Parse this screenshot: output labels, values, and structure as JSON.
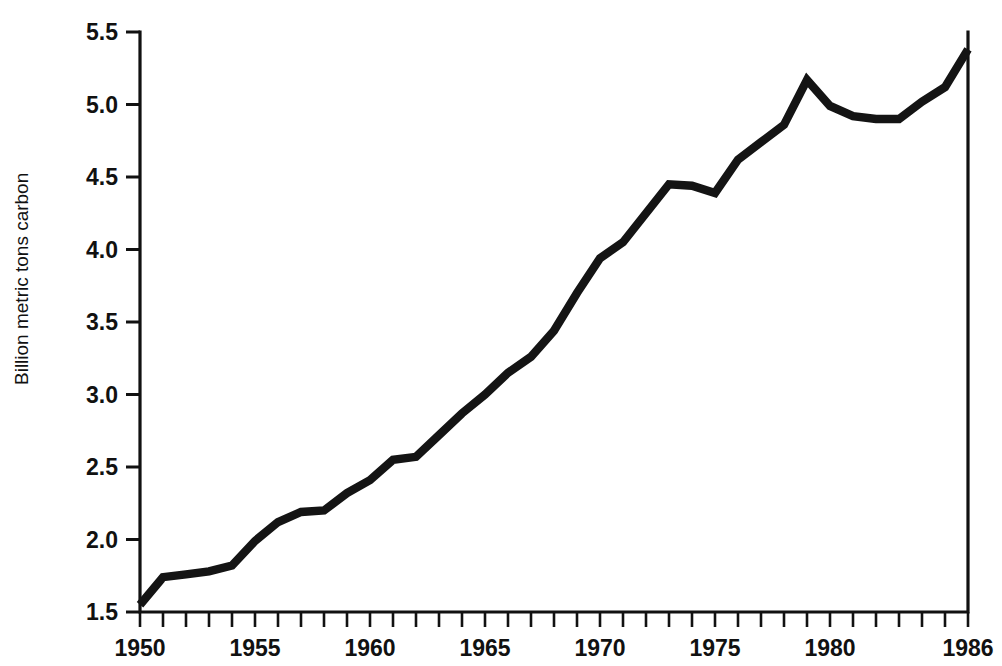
{
  "chart_data": {
    "type": "line",
    "title": "",
    "subtitle": "",
    "xlabel": "",
    "ylabel": "Billion metric tons carbon",
    "xlim": [
      1950,
      1986
    ],
    "ylim": [
      1.5,
      5.5
    ],
    "grid": false,
    "legend": "none",
    "y_ticks": [
      "1.5",
      "2.0",
      "2.5",
      "3.0",
      "3.5",
      "4.0",
      "4.5",
      "5.0",
      "5.5"
    ],
    "y_tick_values": [
      1.5,
      2.0,
      2.5,
      3.0,
      3.5,
      4.0,
      4.5,
      5.0,
      5.5
    ],
    "x_ticks_labeled": [
      "1950",
      "1955",
      "1960",
      "1965",
      "1970",
      "1975",
      "1980",
      "1986"
    ],
    "x_tick_values_labeled": [
      1950,
      1955,
      1960,
      1965,
      1970,
      1975,
      1980,
      1986
    ],
    "x_tick_minor_interval": 1,
    "line_color": "#141414",
    "x": [
      1950,
      1951,
      1952,
      1953,
      1954,
      1955,
      1956,
      1957,
      1958,
      1959,
      1960,
      1961,
      1962,
      1963,
      1964,
      1965,
      1966,
      1967,
      1968,
      1969,
      1970,
      1971,
      1972,
      1973,
      1974,
      1975,
      1976,
      1977,
      1978,
      1979,
      1980,
      1981,
      1982,
      1983,
      1984,
      1985,
      1986
    ],
    "values": [
      1.55,
      1.74,
      1.76,
      1.78,
      1.82,
      1.99,
      2.12,
      2.19,
      2.2,
      2.32,
      2.41,
      2.55,
      2.57,
      2.72,
      2.87,
      3.0,
      3.15,
      3.26,
      3.44,
      3.7,
      3.94,
      4.05,
      4.25,
      4.45,
      4.44,
      4.39,
      4.62,
      4.74,
      4.86,
      5.17,
      4.99,
      4.92,
      4.9,
      4.9,
      5.02,
      5.12,
      5.38
    ],
    "series": [
      {
        "name": "Global carbon emissions",
        "values": [
          1.55,
          1.74,
          1.76,
          1.78,
          1.82,
          1.99,
          2.12,
          2.19,
          2.2,
          2.32,
          2.41,
          2.55,
          2.57,
          2.72,
          2.87,
          3.0,
          3.15,
          3.26,
          3.44,
          3.7,
          3.94,
          4.05,
          4.25,
          4.45,
          4.44,
          4.39,
          4.62,
          4.74,
          4.86,
          5.17,
          4.99,
          4.92,
          4.9,
          4.9,
          5.02,
          5.12,
          5.38
        ]
      }
    ]
  }
}
